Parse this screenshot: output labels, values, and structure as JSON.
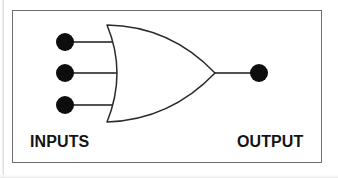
{
  "document": {
    "type": "logic-gate-diagram",
    "title": "3-input OR gate diagram",
    "background_color": "#ffffff",
    "border_color": "#6e6e6e"
  },
  "diagram": {
    "gate": {
      "name": "or-gate",
      "symbol_standard": "distinctive-shape",
      "input_count": 3,
      "output_count": 1,
      "stroke_color": "#222222",
      "fill_color": "#ffffff"
    },
    "terminals": {
      "dot_color": "#0d0d0d",
      "wire_color": "#1a1a1a",
      "inputs": [
        {
          "name": "input-terminal-1",
          "cx": 65,
          "cy": 42,
          "r": 9
        },
        {
          "name": "input-terminal-2",
          "cx": 65,
          "cy": 73,
          "r": 9
        },
        {
          "name": "input-terminal-3",
          "cx": 65,
          "cy": 105,
          "r": 9
        }
      ],
      "outputs": [
        {
          "name": "output-terminal-1",
          "cx": 259,
          "cy": 73,
          "r": 9
        }
      ]
    },
    "labels": {
      "inputs": "INPUTS",
      "output": "OUTPUT"
    }
  }
}
